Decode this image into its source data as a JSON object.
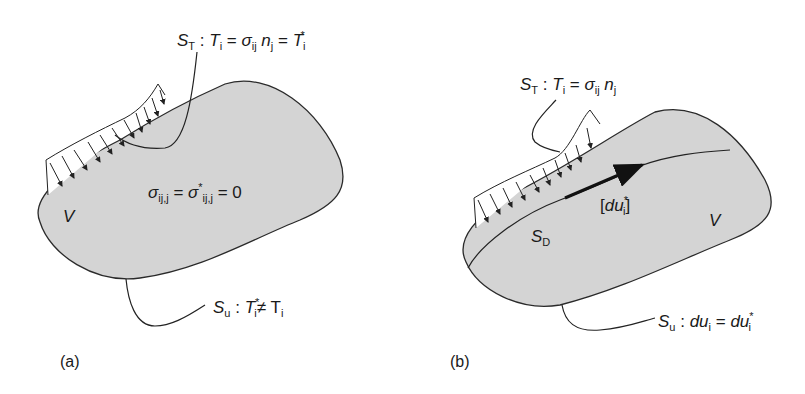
{
  "panels": [
    {
      "id": "a",
      "caption": "(a)",
      "labels": {
        "traction_surface": {
          "S": "S",
          "S_sub": "T",
          "sep": " : ",
          "T": "T",
          "T_sub": "i",
          "eq1": " = ",
          "sigma": "σ",
          "sigma_sub": "ij",
          "n": " n",
          "n_sub": "j",
          "eq2": " = ",
          "T2": "T",
          "T2_sub": "i",
          "T2_sup": "*"
        },
        "equilibrium": {
          "sigma": "σ",
          "sub1": "ij,j",
          "eq1": " = ",
          "sigma2": "σ",
          "sup2": "*",
          "sub2": "ij,j",
          "eq2": " = 0"
        },
        "volume": "V",
        "displacement_surface": {
          "S": "S",
          "S_sub": "u",
          "sep": " : ",
          "T": "T",
          "T_sup": "*",
          "T_sub": "i",
          "neq": "≠ ",
          "T2": "T",
          "T2_sub": "i"
        }
      }
    },
    {
      "id": "b",
      "caption": "(b)",
      "labels": {
        "traction_surface": {
          "S": "S",
          "S_sub": "T",
          "sep": " : ",
          "T": "T",
          "T_sub": "i",
          "eq": " = ",
          "sigma": "σ",
          "sigma_sub": "ij",
          "n": " n",
          "n_sub": "j"
        },
        "displacement_jump": {
          "open": "[",
          "du": "du",
          "sup": "*",
          "sub": "i",
          "close": "]"
        },
        "discontinuity_surface": {
          "S": "S",
          "S_sub": "D"
        },
        "volume": "V",
        "displacement_surface": {
          "S": "S",
          "S_sub": "u",
          "sep": " : ",
          "du": "du",
          "du_sub": "i",
          "eq": " = ",
          "du2": "du",
          "du2_sub": "i",
          "du2_sup": "*"
        }
      }
    }
  ],
  "colors": {
    "body_fill": "#d4d4d4",
    "stroke": "#2a2a2a"
  }
}
